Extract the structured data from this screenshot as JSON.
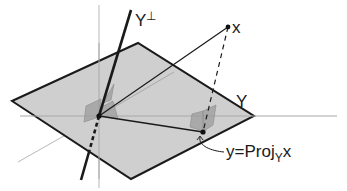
{
  "diagram": {
    "labels": {
      "orth_complement": "Y",
      "orth_complement_sup": "⊥",
      "subspace": "Y",
      "vector": "x",
      "projection_prefix": "y=Proj",
      "projection_sub": "Y",
      "projection_suffix": "x"
    },
    "colors": {
      "plane_fill": "#cfcfcf",
      "plane_edge": "#1a1a1a",
      "axis": "#b5b5b5",
      "line": "#1a1a1a",
      "right_angle_marker": "#9a9a9a"
    },
    "points": {
      "origin": [
        99,
        116
      ],
      "x": [
        228,
        27
      ],
      "y": [
        203,
        132
      ]
    },
    "plane_corners": [
      [
        12,
        101
      ],
      [
        138,
        43
      ],
      [
        254,
        116
      ],
      [
        131,
        179
      ]
    ]
  }
}
